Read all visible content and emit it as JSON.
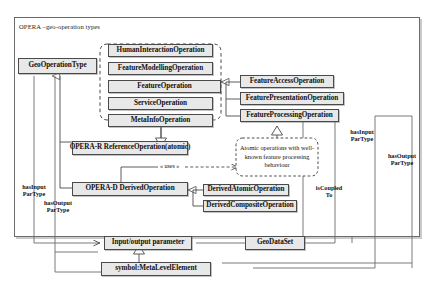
{
  "diagram": {
    "frame_title": "OPERA –geo-operation types",
    "nodes": {
      "geo_operation_type": "GeoOperationType",
      "human_interaction_operation": "HumanInteractionOperation",
      "feature_modelling_operation": "FeatureModellingOperation",
      "feature_operation": "FeatureOperation",
      "service_operation": "ServiceOperation",
      "meta_info_operation": "MetaInfoOperation",
      "feature_access_operation": "FeatureAccessOperation",
      "feature_presentation_operation": "FeaturePresentationOperation",
      "feature_processing_operation": "FeatureProcessingOperation",
      "opera_r_reference_operation": "OPERA-R ReferenceOperation(atomic)",
      "opera_d_derived_operation": "OPERA-D DerivedOperation",
      "derived_atomic_operation": "DerivedAtomicOperation",
      "derived_composite_operation": "DerivedCompositeOperation",
      "input_output_parameter": "Input/output parameter",
      "geo_data_set": "GeoDataSet",
      "symbol_meta_level_element": "symbol:MetaLevelElement"
    },
    "note": "Atomic operations with well-known feature processing behaviour",
    "edge_labels": {
      "uses": "« uses »",
      "left_has_input": "hasInput\nParType",
      "left_has_output": "hasOutput\nParType",
      "right_has_input": "hasInput\nParType",
      "right_has_output": "hasOutput\nParType",
      "is_coupled_to": "isCoupled\nTo"
    },
    "colors": {
      "node_fill": "#e8e8e8",
      "node_border": "#4a4a4a",
      "line": "#6b6b6b",
      "text": "#111111",
      "background": "#ffffff"
    }
  }
}
